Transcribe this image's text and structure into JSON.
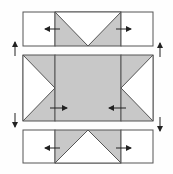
{
  "colors": {
    "background": "#fefefe",
    "fabric_light": "#ffffff",
    "fabric_dark": "#c8c8c8",
    "stroke": "#555555",
    "arrow": "#222222"
  },
  "rows": [
    {
      "name": "top-row",
      "units": [
        "corner-square",
        "flying-geese-down",
        "corner-square"
      ],
      "press_arrows": [
        "left",
        "right"
      ]
    },
    {
      "name": "middle-row",
      "units": [
        "flying-geese-right",
        "center-square",
        "flying-geese-left"
      ],
      "press_arrows": [
        "right",
        "left"
      ]
    },
    {
      "name": "bottom-row",
      "units": [
        "corner-square",
        "flying-geese-up",
        "corner-square"
      ],
      "press_arrows": [
        "left",
        "right"
      ]
    }
  ],
  "seam_arrows": {
    "top_seam": "up",
    "bottom_seam": "down"
  }
}
